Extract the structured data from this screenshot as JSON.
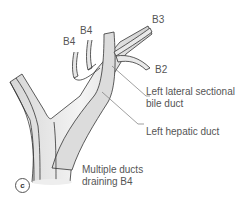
{
  "figure": {
    "panel_label": "c",
    "labels": {
      "b3": "B3",
      "b2": "B2",
      "b4_left": "B4",
      "b4_right": "B4",
      "left_lateral_line1": "Left lateral sectional",
      "left_lateral_line2": "bile duct",
      "left_hepatic": "Left hepatic duct",
      "multiple_line1": "Multiple ducts",
      "multiple_line2": "draining B4"
    },
    "colors": {
      "duct_fill": "#e9e9e9",
      "duct_outline": "#333333",
      "leader_line": "#777777",
      "text": "#555555"
    }
  }
}
